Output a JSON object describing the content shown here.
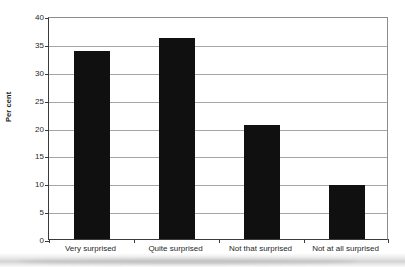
{
  "chart_data": {
    "type": "bar",
    "title": "",
    "xlabel": "",
    "ylabel": "Per cent",
    "categories": [
      "Very surprised",
      "Quite surprised",
      "Not that surprised",
      "Not at all surprised"
    ],
    "values": [
      33.7,
      36.0,
      20.5,
      9.7
    ],
    "ylim": [
      0,
      40
    ],
    "ytick_labels": [
      "0",
      "5",
      "10",
      "15",
      "20",
      "25",
      "30",
      "35",
      "40"
    ],
    "ytick_values": [
      0,
      5,
      10,
      15,
      20,
      25,
      30,
      35,
      40
    ],
    "grid": true,
    "legend": false,
    "bar_color": "#101010",
    "grid_color": "#a6a6a6",
    "axis_color": "#3a3a3a",
    "background": "#ffffff"
  }
}
